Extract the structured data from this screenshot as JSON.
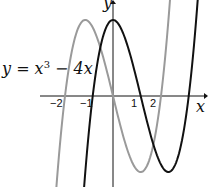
{
  "chart_data": {
    "type": "line",
    "title": "",
    "xlabel": "x",
    "ylabel": "y",
    "xlim": [
      -2.3,
      4.0
    ],
    "ylim": [
      -3.6,
      3.9
    ],
    "x_ticks": [
      "-2",
      "-1",
      "1",
      "2"
    ],
    "series": [
      {
        "name": "y = x^3 - 4x",
        "color": "#9a9a9a",
        "formula": "x^3-4x",
        "shift": 0
      },
      {
        "name": "shifted curve",
        "color": "#111111",
        "formula": "(x-h)^3-4(x-h)",
        "shift": 1.155
      }
    ],
    "annotations": [
      "y = x³ − 4x"
    ]
  },
  "labels": {
    "equation_main": "y = x",
    "equation_exp": "3",
    "equation_tail": " − 4x",
    "x_axis": "x",
    "y_axis": "y",
    "tick_m2": "−2",
    "tick_m1": "−1",
    "tick_1": "1",
    "tick_2": "2"
  }
}
